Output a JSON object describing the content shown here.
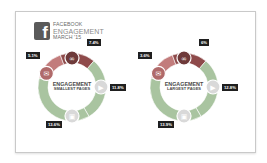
{
  "header": {
    "brand_icon": "facebook-icon",
    "brand_glyph": "f",
    "title_line1": "FACEBOOK",
    "title_line2": "ENGAGEMENT",
    "title_line3": "MARCH '15"
  },
  "colors": {
    "link": "#8e4a4a",
    "comment": "#c27c7c",
    "video": "#a9c4a0",
    "photo": "#a9c4a0",
    "icon_circle": "#8d8d8d",
    "label_bg": "#1f1f1f"
  },
  "chart_data": [
    {
      "type": "pie",
      "variant": "donut",
      "title": "ENGAGEMENT",
      "subtitle": "SMALLEST PAGES",
      "categories": [
        "Comment",
        "Link",
        "Video",
        "Photo"
      ],
      "icons": [
        "comment-icon",
        "link-icon",
        "play-icon",
        "photo-icon"
      ],
      "values": [
        5.1,
        7.4,
        11.8,
        13.6
      ],
      "labels": [
        "5.1%",
        "7.4%",
        "11.8%",
        "13.6%"
      ]
    },
    {
      "type": "pie",
      "variant": "donut",
      "title": "ENGAGEMENT",
      "subtitle": "LARGEST PAGES",
      "categories": [
        "Comment",
        "Link",
        "Video",
        "Photo"
      ],
      "icons": [
        "comment-icon",
        "link-icon",
        "play-icon",
        "photo-icon"
      ],
      "values": [
        3.6,
        6,
        12.8,
        13.9
      ],
      "labels": [
        "3.6%",
        "6%",
        "12.8%",
        "13.9%"
      ]
    }
  ]
}
